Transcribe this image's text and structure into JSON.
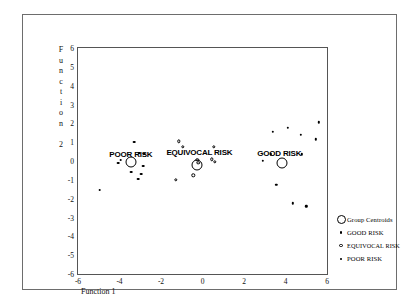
{
  "chart_data": {
    "type": "scatter",
    "title": "",
    "xlabel": "Function 1",
    "ylabel": "Function 2",
    "xlim": [
      -6,
      6
    ],
    "ylim": [
      -6,
      6
    ],
    "xticks": [
      "-6",
      "-4",
      "-2",
      "0",
      "2",
      "4",
      "6"
    ],
    "yticks": [
      "6",
      "5",
      "4",
      "3",
      "2",
      "1",
      "0",
      "-1",
      "-2",
      "-3",
      "-4",
      "-5",
      "-6"
    ],
    "grid": false,
    "legend_position": "right",
    "series": [
      {
        "name": "GOOD RISK",
        "marker": "filled-dot",
        "points": [
          [
            2.9,
            0.0
          ],
          [
            3.3,
            0.35
          ],
          [
            3.4,
            1.55
          ],
          [
            3.55,
            -1.25
          ],
          [
            4.1,
            1.75
          ],
          [
            4.35,
            -2.25
          ],
          [
            4.75,
            1.4
          ],
          [
            4.8,
            0.35
          ],
          [
            5.0,
            -2.4
          ],
          [
            5.45,
            1.15
          ],
          [
            5.6,
            2.05
          ]
        ]
      },
      {
        "name": "EQUIVOCAL RISK",
        "marker": "open-circle",
        "points": [
          [
            -1.15,
            1.05
          ],
          [
            -0.95,
            0.75
          ],
          [
            -0.25,
            0.05
          ],
          [
            -0.2,
            -0.1
          ],
          [
            0.45,
            0.1
          ],
          [
            0.6,
            -0.05
          ],
          [
            -0.45,
            -0.75
          ],
          [
            -1.3,
            -1.0
          ],
          [
            0.55,
            0.75
          ]
        ]
      },
      {
        "name": "POOR RISK",
        "marker": "dash-dot",
        "points": [
          [
            -3.3,
            1.0
          ],
          [
            -3.05,
            0.4
          ],
          [
            -2.8,
            0.35
          ],
          [
            -2.85,
            -0.25
          ],
          [
            -3.95,
            0.05
          ],
          [
            -4.05,
            -0.1
          ],
          [
            -3.45,
            -0.6
          ],
          [
            -2.95,
            -0.7
          ],
          [
            -3.1,
            -0.95
          ],
          [
            -4.95,
            -1.55
          ]
        ]
      },
      {
        "name": "Group Centroids",
        "marker": "large-open-circle",
        "points": [
          [
            -3.45,
            -0.05
          ],
          [
            -0.25,
            -0.2
          ],
          [
            3.85,
            -0.1
          ]
        ]
      }
    ],
    "annotations": [
      {
        "text": "POOR RISK",
        "x": -3.45,
        "y": 0.35
      },
      {
        "text": "EQUIVOCAL RISK",
        "x": -0.15,
        "y": 0.5
      },
      {
        "text": "GOOD RISK",
        "x": 3.7,
        "y": 0.4
      }
    ],
    "legend": [
      {
        "label": "Group Centroids",
        "marker": "large-open-circle"
      },
      {
        "label": "GOOD RISK",
        "marker": "filled-dot"
      },
      {
        "label": "EQUIVOCAL RISK",
        "marker": "open-circle"
      },
      {
        "label": "POOR RISK",
        "marker": "dash-dot"
      }
    ]
  }
}
